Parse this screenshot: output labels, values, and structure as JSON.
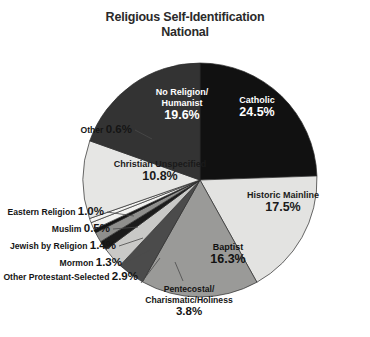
{
  "title": {
    "line1": "Religious Self-Identification",
    "line2": "National"
  },
  "chart_data": {
    "type": "pie",
    "title": "Religious Self-Identification National",
    "units": "percent",
    "legend": "none",
    "start_angle_deg": 0,
    "direction": "clockwise",
    "categories": [
      "Catholic",
      "Historic Mainline",
      "Baptist",
      "Pentecostal/Charismatic/Holiness",
      "Other Protestant-Selected",
      "Mormon",
      "Jewish by Religion",
      "Muslim",
      "Eastern Religion",
      "Other",
      "Christian Unspecified",
      "No Religion/Humanist"
    ],
    "values": [
      24.5,
      17.5,
      16.3,
      3.8,
      2.9,
      1.3,
      1.4,
      0.5,
      1.0,
      0.6,
      10.8,
      19.6
    ],
    "slices": [
      {
        "label": "Catholic",
        "value": 24.5,
        "value_text": "24.5%",
        "color": "#111111",
        "text_color": "#ffffff",
        "placement": "inside",
        "label_x": 257,
        "label_y": 103,
        "name_lines": [
          "Catholic"
        ]
      },
      {
        "label": "Historic Mainline",
        "value": 17.5,
        "value_text": "17.5%",
        "color": "#e3e3e1",
        "text_color": "#1a1a1a",
        "placement": "inside",
        "label_x": 283,
        "label_y": 198,
        "name_lines": [
          "Historic Mainline"
        ]
      },
      {
        "label": "Baptist",
        "value": 16.3,
        "value_text": "16.3%",
        "color": "#9a9a98",
        "text_color": "#111111",
        "placement": "inside",
        "label_x": 228,
        "label_y": 250,
        "name_lines": [
          "Baptist"
        ]
      },
      {
        "label": "Pentecostal/Charismatic/Holiness",
        "value": 3.8,
        "value_text": "3.8%",
        "color": "#4b4b4b",
        "text_color": "#151515",
        "placement": "callout",
        "label_x": 189,
        "label_y": 292,
        "anchor": "middle",
        "name_lines": [
          "Pentecostal/",
          "Charismatic/Holiness"
        ],
        "leader": "M 183,281 L 175,262"
      },
      {
        "label": "Other Protestant-Selected",
        "value": 2.9,
        "value_text": "2.9%",
        "color": "#c9c9c7",
        "text_color": "#151515",
        "placement": "callout",
        "label_x": 138,
        "label_y": 280,
        "anchor": "end",
        "name_lines": [
          "Other Protestant-Selected"
        ],
        "leader": "M 141,283 L 160,258"
      },
      {
        "label": "Mormon",
        "value": 1.3,
        "value_text": "1.3%",
        "color": "#1b1b1b",
        "text_color": "#151515",
        "placement": "callout",
        "label_x": 122,
        "label_y": 266,
        "anchor": "end",
        "name_lines": [
          "Mormon"
        ],
        "leader": "M 125,263 L 150,250"
      },
      {
        "label": "Jewish by Religion",
        "value": 1.4,
        "value_text": "1.4%",
        "color": "#8f8f8d",
        "text_color": "#151515",
        "placement": "callout",
        "label_x": 116,
        "label_y": 249,
        "anchor": "end",
        "name_lines": [
          "Jewish by Religion"
        ],
        "leader": "M 119,246 L 143,238"
      },
      {
        "label": "Muslim",
        "value": 0.5,
        "value_text": "0.5%",
        "color": "#131313",
        "text_color": "#151515",
        "placement": "callout",
        "label_x": 110,
        "label_y": 232,
        "anchor": "end",
        "name_lines": [
          "Muslim"
        ],
        "leader": "M 113,229 L 138,227"
      },
      {
        "label": "Eastern Religion",
        "value": 1.0,
        "value_text": "1.0%",
        "color": "#f2f2f0",
        "text_color": "#151515",
        "placement": "callout",
        "label_x": 104,
        "label_y": 215,
        "anchor": "end",
        "name_lines": [
          "Eastern Religion"
        ],
        "leader": "M 107,212 L 134,216"
      },
      {
        "label": "Other",
        "value": 0.6,
        "value_text": "0.6%",
        "color": "#f4f4f2",
        "text_color": "#151515",
        "placement": "callout",
        "label_x": 132,
        "label_y": 133,
        "anchor": "end",
        "name_lines": [
          "Other"
        ],
        "leader": "M 135,130 L 152,139"
      },
      {
        "label": "Christian Unspecified",
        "value": 10.8,
        "value_text": "10.8%",
        "color": "#e6e6e4",
        "text_color": "#1a1a1a",
        "placement": "inside",
        "label_x": 160,
        "label_y": 167,
        "name_lines": [
          "Christian Unspecified"
        ]
      },
      {
        "label": "No Religion/Humanist",
        "value": 19.6,
        "value_text": "19.6%",
        "color": "#333333",
        "text_color": "#ffffff",
        "placement": "inside",
        "label_x": 182,
        "label_y": 95,
        "name_lines": [
          "No Religion/",
          "Humanist"
        ]
      }
    ],
    "geometry": {
      "cx": 200,
      "cy": 180,
      "r": 117
    }
  }
}
